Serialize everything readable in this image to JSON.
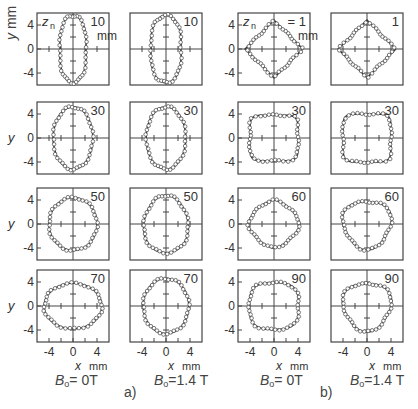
{
  "figure": {
    "groups": [
      {
        "label": "a)",
        "columns": [
          {
            "field_label": "B₀= 0T",
            "z_values": [
              "10",
              "30",
              "50",
              "70"
            ]
          },
          {
            "field_label": "B₀=1.4 T",
            "z_values": [
              "10",
              "30",
              "50",
              "70"
            ]
          }
        ]
      },
      {
        "label": "b)",
        "columns": [
          {
            "field_label": "B₀= 0T",
            "z_values": [
              "1",
              "30",
              "60",
              "90"
            ]
          },
          {
            "field_label": "B₀=1.4 T",
            "z_values": [
              "1",
              "30",
              "60",
              "90"
            ]
          }
        ]
      }
    ],
    "y_axis_label": "y",
    "y_axis_unit": "mm",
    "x_axis_label": "x",
    "x_axis_unit": "mm",
    "z_label": "zₙ",
    "z_unit": "mm",
    "y_ticks": [
      "4",
      "0",
      "-4"
    ],
    "x_ticks": [
      "-4",
      "0",
      "4"
    ],
    "labels": {
      "a": "a)",
      "b": "b)",
      "b0_a1": "B",
      "b0_sub": "o",
      "b0_a1_val": "= 0T",
      "b0_a2_val": "=1.4 T",
      "b0_b1_val": "= 0T",
      "b0_b2_val": "=1.4 T",
      "first_z_a": "10",
      "first_z_b": "= 1",
      "mm": "mm",
      "zn": "z"
    }
  },
  "chart_data": {
    "type": "scatter",
    "title": "",
    "xlabel": "x mm",
    "ylabel": "y mm",
    "xlim": [
      -6,
      6
    ],
    "ylim": [
      -6,
      6
    ],
    "x_ticks": [
      -4,
      0,
      4
    ],
    "y_ticks": [
      -4,
      0,
      4
    ],
    "panels": [
      {
        "group": "a",
        "B0": "0T",
        "z_mm": 10,
        "shape": "peanut",
        "half_width": 2.6,
        "half_height": 5.6
      },
      {
        "group": "a",
        "B0": "0T",
        "z_mm": 30,
        "shape": "ellipse",
        "half_width": 3.3,
        "half_height": 5.2
      },
      {
        "group": "a",
        "B0": "0T",
        "z_mm": 50,
        "shape": "ellipse",
        "half_width": 4.0,
        "half_height": 4.4
      },
      {
        "group": "a",
        "B0": "0T",
        "z_mm": 70,
        "shape": "ellipse",
        "half_width": 4.8,
        "half_height": 3.8
      },
      {
        "group": "a",
        "B0": "1.4T",
        "z_mm": 10,
        "shape": "peanut",
        "half_width": 3.0,
        "half_height": 5.6
      },
      {
        "group": "a",
        "B0": "1.4T",
        "z_mm": 30,
        "shape": "ellipse",
        "half_width": 3.3,
        "half_height": 5.2
      },
      {
        "group": "a",
        "B0": "1.4T",
        "z_mm": 50,
        "shape": "egg",
        "half_width": 3.7,
        "half_height": 4.8
      },
      {
        "group": "a",
        "B0": "1.4T",
        "z_mm": 70,
        "shape": "ellipse",
        "half_width": 3.8,
        "half_height": 4.6
      },
      {
        "group": "b",
        "B0": "0T",
        "z_mm": 1,
        "shape": "diamond",
        "half_width": 4.8,
        "half_height": 4.8
      },
      {
        "group": "b",
        "B0": "0T",
        "z_mm": 30,
        "shape": "square",
        "half_width": 4.0,
        "half_height": 3.8
      },
      {
        "group": "b",
        "B0": "0T",
        "z_mm": 60,
        "shape": "rounded-diamond",
        "half_width": 4.3,
        "half_height": 4.0
      },
      {
        "group": "b",
        "B0": "0T",
        "z_mm": 90,
        "shape": "rounded-square",
        "half_width": 4.1,
        "half_height": 3.9
      },
      {
        "group": "b",
        "B0": "1.4T",
        "z_mm": 1,
        "shape": "diamond",
        "half_width": 4.8,
        "half_height": 4.8
      },
      {
        "group": "b",
        "B0": "1.4T",
        "z_mm": 30,
        "shape": "square",
        "half_width": 4.0,
        "half_height": 4.0
      },
      {
        "group": "b",
        "B0": "1.4T",
        "z_mm": 60,
        "shape": "rounded-triangle",
        "half_width": 4.0,
        "half_height": 4.0
      },
      {
        "group": "b",
        "B0": "1.4T",
        "z_mm": 90,
        "shape": "rounded-triangle",
        "half_width": 4.0,
        "half_height": 4.0
      }
    ],
    "grid": false,
    "legend": null
  }
}
